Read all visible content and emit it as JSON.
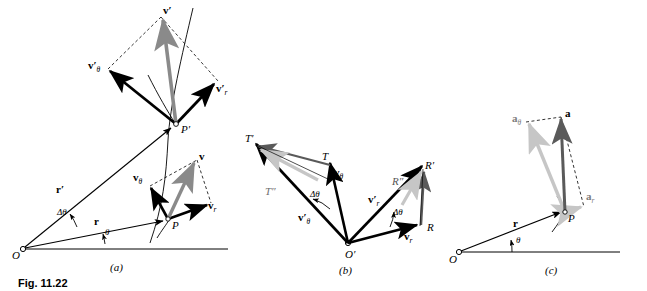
{
  "figure": {
    "caption": "Fig. 11.22",
    "panels": [
      {
        "id": "a",
        "label": "(a)"
      },
      {
        "id": "b",
        "label": "(b)"
      },
      {
        "id": "c",
        "label": "(c)"
      }
    ]
  },
  "colors": {
    "ink": "#000000",
    "gray_mid": "#8a8a8a",
    "gray_light": "#c6c6c6",
    "gray_dark": "#5a5a5a",
    "dashed": "#333333",
    "paper": "#ffffff"
  },
  "panel_a": {
    "caption": "(a)",
    "points": [
      {
        "name": "O",
        "label": "O",
        "x": 22,
        "y": 248
      },
      {
        "name": "P",
        "label": "P",
        "x": 168,
        "y": 219
      },
      {
        "name": "P-prime",
        "label": "P′",
        "x": 176,
        "y": 124
      }
    ],
    "vectors": [
      {
        "name": "r",
        "label": "r",
        "color": "#000000",
        "style": "solid"
      },
      {
        "name": "r-prime",
        "label": "r′",
        "color": "#000000",
        "style": "solid"
      },
      {
        "name": "v",
        "label": "v",
        "color": "#8a8a8a",
        "style": "solid"
      },
      {
        "name": "v-theta",
        "label": "v",
        "sub": "θ",
        "color": "#000000",
        "style": "solid"
      },
      {
        "name": "v-r",
        "label": "v",
        "sub": "r",
        "color": "#000000",
        "style": "solid"
      },
      {
        "name": "v-prime",
        "label": "v′",
        "color": "#8a8a8a",
        "style": "solid"
      },
      {
        "name": "v-prime-theta",
        "label": "v′",
        "sub": "θ",
        "color": "#000000",
        "style": "solid"
      },
      {
        "name": "v-prime-r",
        "label": "v′",
        "sub": "r",
        "color": "#000000",
        "style": "solid"
      }
    ],
    "angles": [
      {
        "name": "theta",
        "label": "θ"
      },
      {
        "name": "delta-theta",
        "label": "Δθ"
      }
    ]
  },
  "panel_b": {
    "caption": "(b)",
    "points": [
      {
        "name": "O-prime",
        "label": "O′"
      },
      {
        "name": "T",
        "label": "T"
      },
      {
        "name": "T-prime",
        "label": "T′"
      },
      {
        "name": "T-double-prime",
        "label": "T″"
      },
      {
        "name": "R",
        "label": "R"
      },
      {
        "name": "R-prime",
        "label": "R′"
      },
      {
        "name": "R-double-prime",
        "label": "R″"
      }
    ],
    "vectors": [
      {
        "name": "v-theta",
        "label": "v",
        "sub": "θ",
        "color": "#000000"
      },
      {
        "name": "v-prime-theta",
        "label": "v′",
        "sub": "θ",
        "color": "#000000"
      },
      {
        "name": "v-r",
        "label": "v",
        "sub": "r",
        "color": "#000000"
      },
      {
        "name": "v-prime-r",
        "label": "v′",
        "sub": "r",
        "color": "#000000"
      }
    ],
    "angles": [
      {
        "name": "delta-theta-left",
        "label": "Δθ"
      },
      {
        "name": "delta-theta-right",
        "label": "Δθ"
      }
    ]
  },
  "panel_c": {
    "caption": "(c)",
    "points": [
      {
        "name": "O",
        "label": "O"
      },
      {
        "name": "P",
        "label": "P"
      }
    ],
    "vectors": [
      {
        "name": "r",
        "label": "r",
        "color": "#000000"
      },
      {
        "name": "a",
        "label": "a",
        "color": "#5a5a5a"
      },
      {
        "name": "a-theta",
        "label": "a",
        "sub": "θ",
        "color": "#c6c6c6"
      },
      {
        "name": "a-r",
        "label": "a",
        "sub": "r",
        "color": "#c6c6c6"
      }
    ],
    "angles": [
      {
        "name": "theta",
        "label": "θ"
      }
    ]
  }
}
